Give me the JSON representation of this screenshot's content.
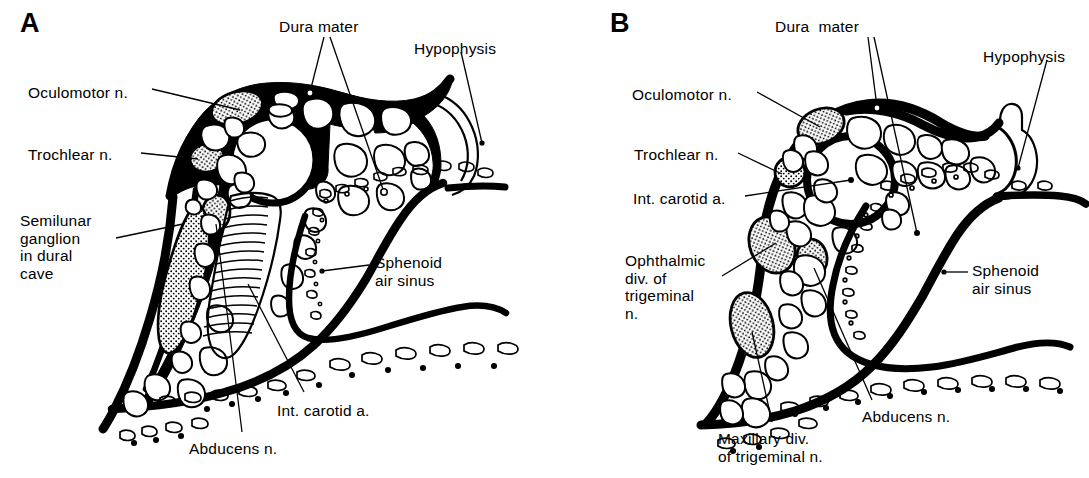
{
  "figure": {
    "background_color": "#ffffff",
    "ink_color": "#000000",
    "width": 1089,
    "height": 478
  },
  "panels": [
    {
      "id": "A",
      "letter": "A",
      "labels": [
        {
          "key": "dura_mater",
          "text": "Dura mater",
          "x": 279,
          "y": 18,
          "align": "left"
        },
        {
          "key": "hypophysis",
          "text": "Hypophysis",
          "x": 414,
          "y": 40,
          "align": "left"
        },
        {
          "key": "oculomotor",
          "text": "Oculomotor n.",
          "x": 28,
          "y": 84,
          "align": "left"
        },
        {
          "key": "trochlear",
          "text": "Trochlear n.",
          "x": 28,
          "y": 146,
          "align": "left"
        },
        {
          "key": "semilunar",
          "text": "Semilunar\nganglion\nin dural\ncave",
          "x": 20,
          "y": 212,
          "align": "left"
        },
        {
          "key": "sphenoid",
          "text": "Sphenoid\nair sinus",
          "x": 375,
          "y": 254,
          "align": "left"
        },
        {
          "key": "int_carotid",
          "text": "Int. carotid a.",
          "x": 277,
          "y": 402,
          "align": "left"
        },
        {
          "key": "abducens",
          "text": "Abducens n.",
          "x": 189,
          "y": 440,
          "align": "left"
        }
      ]
    },
    {
      "id": "B",
      "letter": "B",
      "labels": [
        {
          "key": "dura_mater",
          "text": "Dura  mater",
          "x": 775,
          "y": 18,
          "align": "left"
        },
        {
          "key": "hypophysis",
          "text": "Hypophysis",
          "x": 983,
          "y": 48,
          "align": "left"
        },
        {
          "key": "oculomotor",
          "text": "Oculomotor n.",
          "x": 632,
          "y": 86,
          "align": "left"
        },
        {
          "key": "trochlear",
          "text": "Trochlear n.",
          "x": 634,
          "y": 146,
          "align": "left"
        },
        {
          "key": "int_carotid",
          "text": "Int. carotid a.",
          "x": 633,
          "y": 190,
          "align": "left"
        },
        {
          "key": "ophthalmic",
          "text": "Ophthalmic\ndiv. of\ntrigeminal\nn.",
          "x": 625,
          "y": 252,
          "align": "left"
        },
        {
          "key": "sphenoid",
          "text": "Sphenoid\nair sinus",
          "x": 972,
          "y": 262,
          "align": "left"
        },
        {
          "key": "abducens",
          "text": "Abducens n.",
          "x": 862,
          "y": 408,
          "align": "left"
        },
        {
          "key": "maxillary",
          "text": "Maxillary div.\nof trigeminal n.",
          "x": 718,
          "y": 430,
          "align": "left"
        }
      ]
    }
  ],
  "structures": {
    "dura_mater": "Thick black outline bounding the cavernous sinus",
    "hypophysis": "Pituitary gland in the median sella, right of each panel",
    "oculomotor_nerve": "Stippled oval, superolateral wall",
    "trochlear_nerve": "Small stippled oval below oculomotor",
    "internal_carotid_artery": "Large circle centre of cavernous sinus",
    "abducens_nerve": "Small stippled oval medial to carotid",
    "semilunar_ganglion": "Elongated stippled mass in dural (Meckel's) cave, panel A",
    "ophthalmic_division": "Stippled oval in lateral wall, panel B",
    "maxillary_division": "Stippled oval inferolateral wall, panel B",
    "sphenoid_air_sinus": "Large air space below and medial to the cavernous sinus",
    "venous_spaces": "Irregular thin-outlined trabeculated compartments"
  }
}
